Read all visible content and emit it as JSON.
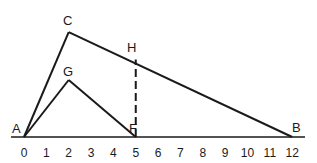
{
  "diagram": {
    "axis": {
      "ticks": [
        "0",
        "1",
        "2",
        "3",
        "4",
        "5",
        "6",
        "7",
        "8",
        "9",
        "10",
        "11",
        "12"
      ],
      "min": 0,
      "max": 12
    },
    "points": {
      "A": {
        "label": "A",
        "x": 0,
        "y": 0
      },
      "B": {
        "label": "B",
        "x": 12,
        "y": 0
      },
      "C": {
        "label": "C",
        "x": 2,
        "y": 4.6
      },
      "G": {
        "label": "G",
        "x": 2,
        "y": 2.5
      },
      "F": {
        "label": "F",
        "x": 5,
        "y": 0
      },
      "H": {
        "label": "H",
        "x": 5,
        "y": 3.4
      }
    },
    "segments": [
      {
        "from": "A",
        "to": "C",
        "style": "solid"
      },
      {
        "from": "C",
        "to": "B",
        "style": "solid"
      },
      {
        "from": "A",
        "to": "G",
        "style": "solid"
      },
      {
        "from": "G",
        "to": "F",
        "style": "solid"
      },
      {
        "from": "F",
        "to": "H",
        "style": "dashed"
      }
    ],
    "line_color": "#1a1a1a"
  }
}
